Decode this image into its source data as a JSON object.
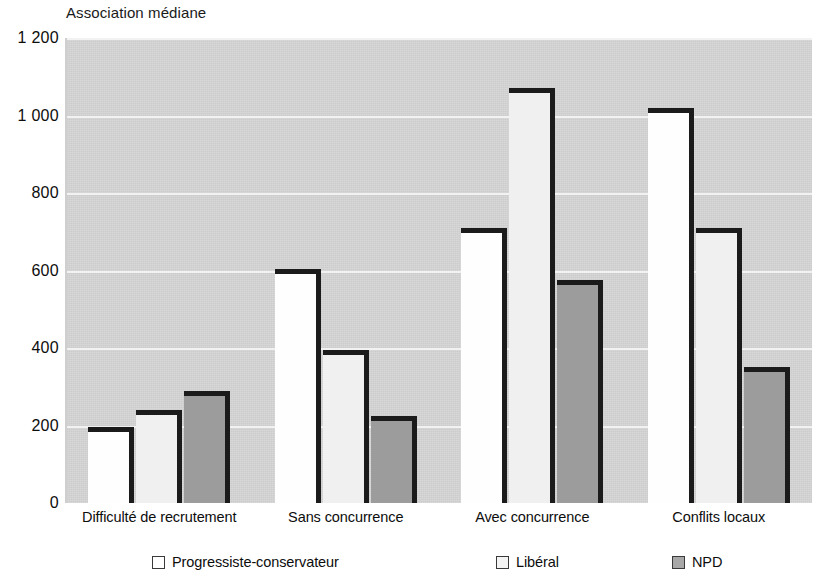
{
  "chart_data": {
    "type": "bar",
    "title": "Association médiane",
    "xlabel": "",
    "ylabel": "",
    "ylim": [
      0,
      1200
    ],
    "yticks": [
      0,
      200,
      400,
      600,
      800,
      1000,
      1200
    ],
    "ytick_labels": [
      "0",
      "200",
      "400",
      "600",
      "800",
      "1 000",
      "1 200"
    ],
    "grid": true,
    "legend_position": "bottom",
    "categories": [
      "Difficulté de recrutement",
      "Sans concurrence",
      "Avec concurrence",
      "Conflits locaux"
    ],
    "series": [
      {
        "name": "Progressiste-conservateur",
        "color": "#ffffff",
        "values": [
          195,
          605,
          710,
          1020
        ]
      },
      {
        "name": "Libéral",
        "color": "#f0f0f0",
        "values": [
          240,
          395,
          1070,
          710
        ]
      },
      {
        "name": "NPD",
        "color": "#9c9c9c",
        "values": [
          290,
          225,
          575,
          350
        ]
      }
    ]
  },
  "colors": {
    "plot_background": "#d6d6d6",
    "gridline": "#f2f2f2",
    "bar_outline": "#1b1b1b",
    "text": "#0d0d0d"
  }
}
